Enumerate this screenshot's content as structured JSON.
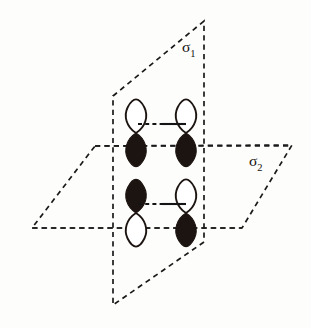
{
  "figure": {
    "background_color": "#fdfdfc",
    "ink_color": "#1a1a1a",
    "width": 311,
    "height": 328
  },
  "planes": [
    {
      "id": "sigma-1",
      "label": "σ",
      "subscript": "1",
      "orientation": "vertical",
      "label_x": 182,
      "label_y": 52,
      "stroke_style": "dashed",
      "color": "#1a1a1a",
      "corners": [
        [
          204,
          21
        ],
        [
          113,
          96
        ],
        [
          113,
          305
        ],
        [
          204,
          242
        ]
      ]
    },
    {
      "id": "sigma-2",
      "label": "σ",
      "subscript": "2",
      "orientation": "horizontal",
      "label_x": 249,
      "label_y": 166,
      "stroke_style": "dashed",
      "color": "#1a1a1a",
      "corners": [
        [
          95,
          146
        ],
        [
          292,
          145
        ],
        [
          242,
          228
        ],
        [
          32,
          228
        ]
      ]
    }
  ],
  "orbitals": [
    {
      "id": "orbital-top-left",
      "position": "upper-left",
      "cx": 136,
      "cy": 130,
      "top_lobe_fill": "open",
      "bottom_lobe_fill": "filled",
      "fill_color": "#1c1410"
    },
    {
      "id": "orbital-top-right",
      "position": "upper-right",
      "cx": 186,
      "cy": 130,
      "top_lobe_fill": "open",
      "bottom_lobe_fill": "filled",
      "fill_color": "#1c1410"
    },
    {
      "id": "orbital-bottom-left",
      "position": "lower-left",
      "cx": 136,
      "cy": 210,
      "top_lobe_fill": "filled",
      "bottom_lobe_fill": "open",
      "fill_color": "#1c1410"
    },
    {
      "id": "orbital-bottom-right",
      "position": "lower-right",
      "cx": 186,
      "cy": 210,
      "top_lobe_fill": "open",
      "bottom_lobe_fill": "filled",
      "fill_color": "#1c1410"
    }
  ],
  "bonds": [
    {
      "id": "bond-upper",
      "x1": 138,
      "x2": 186,
      "y": 124,
      "left_half_style": "dashed",
      "right_half_style": "solid"
    },
    {
      "id": "bond-lower",
      "x1": 138,
      "x2": 186,
      "y": 204,
      "left_half_style": "dashed",
      "right_half_style": "solid"
    }
  ]
}
